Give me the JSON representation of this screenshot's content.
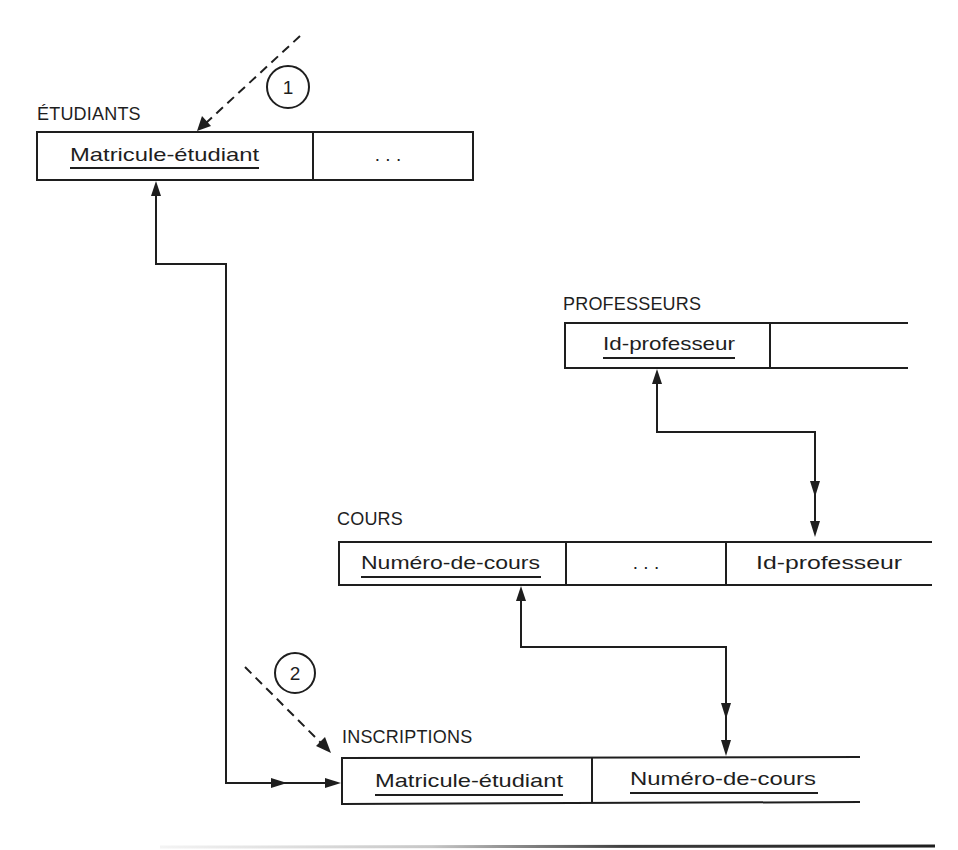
{
  "diagram": {
    "colors": {
      "ink": "#1e1e1e",
      "background": "#ffffff"
    },
    "tables": [
      {
        "name": "ÉTUDIANTS",
        "fields": [
          {
            "label": "Matricule-étudiant",
            "primary_key": true
          },
          {
            "label": ". . .",
            "primary_key": false
          }
        ]
      },
      {
        "name": "PROFESSEURS",
        "fields": [
          {
            "label": "Id-professeur",
            "primary_key": true
          },
          {
            "label": "",
            "primary_key": false
          }
        ]
      },
      {
        "name": "COURS",
        "fields": [
          {
            "label": "Numéro-de-cours",
            "primary_key": true
          },
          {
            "label": ". . .",
            "primary_key": false
          },
          {
            "label": "Id-professeur",
            "primary_key": false
          }
        ]
      },
      {
        "name": "INSCRIPTIONS",
        "fields": [
          {
            "label": "Matricule-étudiant",
            "primary_key": true
          },
          {
            "label": "Numéro-de-cours",
            "primary_key": true
          }
        ]
      }
    ],
    "markers": [
      {
        "label": "1",
        "target": "ÉTUDIANTS"
      },
      {
        "label": "2",
        "target": "INSCRIPTIONS"
      }
    ],
    "relationships": [
      {
        "from": "INSCRIPTIONS.Matricule-étudiant",
        "to": "ÉTUDIANTS.Matricule-étudiant"
      },
      {
        "from": "COURS.Id-professeur",
        "to": "PROFESSEURS.Id-professeur"
      },
      {
        "from": "INSCRIPTIONS.Numéro-de-cours",
        "to": "COURS.Numéro-de-cours"
      }
    ]
  }
}
